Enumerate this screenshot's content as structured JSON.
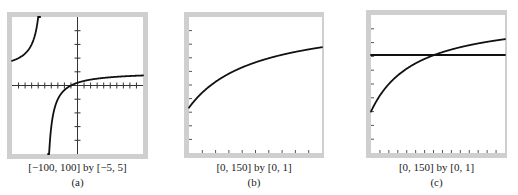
{
  "chart_data": [
    {
      "id": "a",
      "type": "line",
      "window_label": "[−100, 100] by [−5, 5]",
      "panel_label": "(a)",
      "xlim": [
        -100,
        100
      ],
      "ylim": [
        -5,
        5
      ],
      "xscl": 10,
      "yscl": 1,
      "show_axes": true,
      "series": [
        {
          "name": "rational",
          "formula": "(x+10)/(x+50)",
          "asymptote_x": -50,
          "samples": [
            [
              -100,
              1.8
            ],
            [
              -75,
              2.6
            ],
            [
              -60,
              5.0
            ],
            [
              -45,
              -7.0
            ],
            [
              -40,
              -3.0
            ],
            [
              -30,
              -1.0
            ],
            [
              -10,
              0.0
            ],
            [
              0,
              0.2
            ],
            [
              25,
              0.47
            ],
            [
              50,
              0.6
            ],
            [
              100,
              0.73
            ]
          ]
        }
      ],
      "grid": false
    },
    {
      "id": "b",
      "type": "line",
      "window_label": "[0, 150] by [0, 1]",
      "panel_label": "(b)",
      "xlim": [
        0,
        150
      ],
      "ylim": [
        0,
        1
      ],
      "xscl": 15,
      "yscl": 0.1,
      "show_axes": false,
      "series": [
        {
          "name": "curve",
          "formula": "(x+25)/(x+75)",
          "samples": [
            [
              0,
              0.33
            ],
            [
              25,
              0.5
            ],
            [
              50,
              0.6
            ],
            [
              75,
              0.67
            ],
            [
              100,
              0.71
            ],
            [
              125,
              0.75
            ],
            [
              150,
              0.78
            ]
          ]
        }
      ],
      "grid": false
    },
    {
      "id": "c",
      "type": "line",
      "window_label": "[0, 150] by [0, 1]",
      "panel_label": "(c)",
      "xlim": [
        0,
        150
      ],
      "ylim": [
        0,
        1
      ],
      "xscl": 10,
      "yscl": 0.1,
      "show_axes": false,
      "series": [
        {
          "name": "curve",
          "formula": "(x+15)/(x+50)",
          "samples": [
            [
              0,
              0.3
            ],
            [
              25,
              0.53
            ],
            [
              50,
              0.65
            ],
            [
              70,
              0.71
            ],
            [
              100,
              0.77
            ],
            [
              125,
              0.8
            ],
            [
              150,
              0.83
            ]
          ]
        },
        {
          "name": "horizontal-line",
          "formula": "0.71",
          "samples": [
            [
              0,
              0.71
            ],
            [
              150,
              0.71
            ]
          ]
        }
      ],
      "grid": false
    }
  ]
}
